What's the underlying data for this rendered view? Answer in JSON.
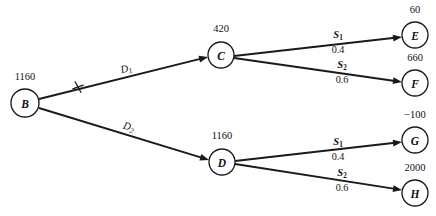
{
  "diagram": {
    "type": "decision-tree",
    "title": "",
    "nodes": [
      {
        "id": "B",
        "label": "B",
        "value": "1160",
        "kind": "decision",
        "cx": 25,
        "cy": 103,
        "r": 14,
        "value_x": 25,
        "value_y": 80
      },
      {
        "id": "C",
        "label": "C",
        "value": "420",
        "kind": "chance",
        "cx": 221,
        "cy": 55,
        "r": 13,
        "value_x": 221,
        "value_y": 32
      },
      {
        "id": "D",
        "label": "D",
        "value": "1160",
        "kind": "chance",
        "cx": 222,
        "cy": 162,
        "r": 13,
        "value_x": 222,
        "value_y": 139
      },
      {
        "id": "E",
        "label": "E",
        "value": "60",
        "kind": "terminal",
        "cx": 415,
        "cy": 35,
        "r": 13,
        "value_x": 415,
        "value_y": 13
      },
      {
        "id": "F",
        "label": "F",
        "value": "660",
        "kind": "terminal",
        "cx": 415,
        "cy": 83,
        "r": 13,
        "value_x": 415,
        "value_y": 61
      },
      {
        "id": "G",
        "label": "G",
        "value": "−100",
        "kind": "terminal",
        "cx": 415,
        "cy": 140,
        "r": 13,
        "value_x": 415,
        "value_y": 118
      },
      {
        "id": "H",
        "label": "H",
        "value": "2000",
        "kind": "terminal",
        "cx": 415,
        "cy": 193,
        "r": 13,
        "value_x": 415,
        "value_y": 171
      }
    ],
    "branches": [
      {
        "id": "B-C",
        "from": "B",
        "to": "C",
        "label": "D",
        "label_sub": "1",
        "probability": "",
        "label_x": 127,
        "label_y": 72,
        "pruned": true,
        "prune_x": 78,
        "prune_y": 87,
        "x1": 39,
        "y1": 99,
        "x2": 208,
        "y2": 57
      },
      {
        "id": "B-D",
        "from": "B",
        "to": "D",
        "label": "D",
        "label_sub": "2",
        "probability": "",
        "label_x": 128,
        "label_y": 130,
        "pruned": false,
        "prune_x": 0,
        "prune_y": 0,
        "x1": 39,
        "y1": 108,
        "x2": 209,
        "y2": 160
      },
      {
        "id": "C-E",
        "from": "C",
        "to": "E",
        "label": "S",
        "label_sub": "1",
        "probability": "0.4",
        "label_x": 338,
        "label_y": 38,
        "prob_x": 338,
        "prob_y": 53,
        "pruned": false,
        "prune_x": 0,
        "prune_y": 0,
        "x1": 234,
        "y1": 56,
        "x2": 402,
        "y2": 37
      },
      {
        "id": "C-F",
        "from": "C",
        "to": "F",
        "label": "S",
        "label_sub": "2",
        "probability": "0.6",
        "label_x": 342,
        "label_y": 68,
        "prob_x": 342,
        "prob_y": 83,
        "pruned": false,
        "prune_x": 0,
        "prune_y": 0,
        "x1": 234,
        "y1": 58,
        "x2": 402,
        "y2": 82
      },
      {
        "id": "D-G",
        "from": "D",
        "to": "G",
        "label": "S",
        "label_sub": "1",
        "probability": "0.4",
        "label_x": 338,
        "label_y": 145,
        "prob_x": 338,
        "prob_y": 160,
        "pruned": false,
        "prune_x": 0,
        "prune_y": 0,
        "x1": 235,
        "y1": 161,
        "x2": 402,
        "y2": 142
      },
      {
        "id": "D-H",
        "from": "D",
        "to": "H",
        "label": "S",
        "label_sub": "2",
        "probability": "0.6",
        "label_x": 342,
        "label_y": 176,
        "prob_x": 342,
        "prob_y": 191,
        "pruned": false,
        "prune_x": 0,
        "prune_y": 0,
        "x1": 235,
        "y1": 164,
        "x2": 402,
        "y2": 190
      }
    ],
    "colors": {
      "stroke": "#1a1a1a",
      "text": "#111111",
      "background": "#ffffff"
    }
  }
}
